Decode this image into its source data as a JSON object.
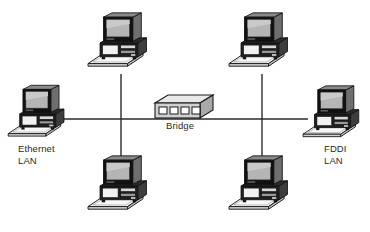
{
  "diagram": {
    "background_color": "#ffffff",
    "line_color": "#2b2b2b",
    "labels": {
      "ethernet_lan": "Ethernet\nLAN",
      "fddi_lan": "FDDI\nLAN",
      "bridge": "Bridge"
    },
    "device_colors": {
      "outline": "#1a1a1a",
      "screen": "#b5b5b5",
      "screen_highlight": "#c9c9c9",
      "bezel": "#111111",
      "case_dark": "#1f1f1f",
      "case_side": "#6e6e6e",
      "keyboard": "#efefef",
      "keyboard_shade": "#d2d2d2",
      "bridge_top": "#e8e8e8",
      "bridge_front": "#d0d0d0",
      "bridge_side": "#a9a9a9",
      "port": "#fdfdfd"
    },
    "nodes": [
      {
        "name": "workstation-ethernet-left",
        "lan": "Ethernet LAN",
        "x": 8,
        "y": 85
      },
      {
        "name": "workstation-ethernet-top",
        "lan": "Ethernet LAN",
        "x": 88,
        "y": 12
      },
      {
        "name": "workstation-ethernet-bottom",
        "lan": "Ethernet LAN",
        "x": 88,
        "y": 155
      },
      {
        "name": "workstation-fddi-top",
        "lan": "FDDI LAN",
        "x": 232,
        "y": 12
      },
      {
        "name": "workstation-fddi-bottom",
        "lan": "FDDI LAN",
        "x": 232,
        "y": 155
      },
      {
        "name": "workstation-fddi-right",
        "lan": "FDDI LAN",
        "x": 305,
        "y": 85
      }
    ],
    "bridge_device": {
      "name": "bridge",
      "port_count": 4,
      "x": 155,
      "y": 95,
      "width": 58,
      "height": 25
    },
    "links": [
      {
        "name": "backbone-segment-ethernet",
        "from": "workstation-ethernet-left",
        "to": "bridge",
        "orientation": "horizontal"
      },
      {
        "name": "backbone-segment-fddi",
        "from": "bridge",
        "to": "workstation-fddi-right",
        "orientation": "horizontal"
      },
      {
        "name": "drop-ethernet-top",
        "from": "workstation-ethernet-top",
        "to": "backbone",
        "orientation": "vertical"
      },
      {
        "name": "drop-ethernet-bottom",
        "from": "backbone",
        "to": "workstation-ethernet-bottom",
        "orientation": "vertical"
      },
      {
        "name": "drop-fddi-top",
        "from": "workstation-fddi-top",
        "to": "backbone",
        "orientation": "vertical"
      },
      {
        "name": "drop-fddi-bottom",
        "from": "backbone",
        "to": "workstation-fddi-bottom",
        "orientation": "vertical"
      }
    ]
  }
}
